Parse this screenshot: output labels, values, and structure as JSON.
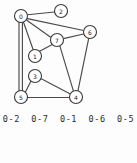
{
  "figure": {
    "background_color": "#fdfdfd",
    "node_fill_color": "#ffffff",
    "node_stroke_color": "#3a3a3a",
    "edge_color": "#4a4a4a",
    "label_color": "#222222"
  },
  "graph": {
    "node_count": 8,
    "node_radius": 6.5,
    "nodes": [
      {
        "id": "0",
        "label": "0",
        "cx": 21,
        "cy": 16
      },
      {
        "id": "1",
        "label": "1",
        "cx": 35,
        "cy": 56
      },
      {
        "id": "2",
        "label": "2",
        "cx": 61,
        "cy": 11
      },
      {
        "id": "3",
        "label": "3",
        "cx": 35,
        "cy": 76
      },
      {
        "id": "4",
        "label": "4",
        "cx": 76,
        "cy": 97
      },
      {
        "id": "5",
        "label": "5",
        "cx": 21,
        "cy": 97
      },
      {
        "id": "6",
        "label": "6",
        "cx": 90,
        "cy": 32
      },
      {
        "id": "7",
        "label": "7",
        "cx": 57,
        "cy": 40
      }
    ],
    "edges": [
      {
        "from": "0",
        "to": "2",
        "x1": 27.4,
        "y1": 14.8,
        "x2": 54.6,
        "y2": 12.0,
        "double": false
      },
      {
        "from": "0",
        "to": "6",
        "x1": 27.4,
        "y1": 18.6,
        "x2": 83.6,
        "y2": 30.5,
        "double": false
      },
      {
        "from": "0",
        "to": "7",
        "x1": 26.8,
        "y1": 20.2,
        "x2": 51.0,
        "y2": 37.5,
        "double": false
      },
      {
        "from": "0",
        "to": "1",
        "x1": 23.5,
        "y1": 22.3,
        "x2": 33.2,
        "y2": 49.7,
        "double": false
      },
      {
        "from": "0",
        "to": "5",
        "x1": 19.0,
        "y1": 22.4,
        "x2": 19.0,
        "y2": 90.6,
        "double": true
      },
      {
        "from": "0",
        "to": "5",
        "x1": 22.4,
        "y1": 22.5,
        "x2": 22.4,
        "y2": 90.5,
        "double": true
      },
      {
        "from": "1",
        "to": "7",
        "x1": 39.6,
        "y1": 51.3,
        "x2": 52.3,
        "y2": 44.5,
        "double": false
      },
      {
        "from": "7",
        "to": "6",
        "x1": 63.4,
        "y1": 38.6,
        "x2": 83.6,
        "y2": 34.0,
        "double": false
      },
      {
        "from": "7",
        "to": "4",
        "x1": 59.9,
        "y1": 46.2,
        "x2": 73.3,
        "y2": 90.6,
        "double": false
      },
      {
        "from": "6",
        "to": "4",
        "x1": 88.7,
        "y1": 38.4,
        "x2": 78.0,
        "y2": 90.6,
        "double": false
      },
      {
        "from": "3",
        "to": "5",
        "x1": 31.0,
        "y1": 81.1,
        "x2": 25.3,
        "y2": 92.3,
        "double": false
      },
      {
        "from": "3",
        "to": "4",
        "x1": 41.3,
        "y1": 78.8,
        "x2": 69.8,
        "y2": 93.7,
        "double": false
      },
      {
        "from": "5",
        "to": "4",
        "x1": 27.5,
        "y1": 97.5,
        "x2": 69.5,
        "y2": 97.5,
        "double": false
      }
    ]
  },
  "caption": {
    "text": "0-2  0-7  0-1  0-6  0-5",
    "pairs": [
      "0-2",
      "0-7",
      "0-1",
      "0-6",
      "0-5"
    ]
  }
}
